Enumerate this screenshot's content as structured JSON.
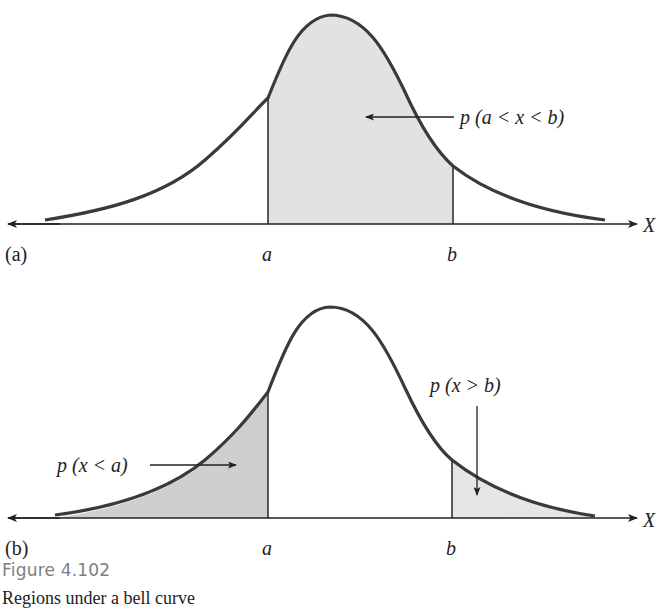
{
  "figure": {
    "number": "Figure 4.102",
    "caption": "Regions under a bell curve"
  },
  "panel_a": {
    "tag": "(a)",
    "axis_label": "X",
    "left_bound_label": "a",
    "right_bound_label": "b",
    "annotation": "p (a < x < b)",
    "shaded_region": "between a and b"
  },
  "panel_b": {
    "tag": "(b)",
    "axis_label": "X",
    "left_bound_label": "a",
    "right_bound_label": "b",
    "annotation_left": "p (x < a)",
    "annotation_right": "p (x > b)",
    "shaded_regions": [
      "left of a",
      "right of b"
    ]
  },
  "colors": {
    "curve": "#3a3a3a",
    "shade_middle": "#e2e2e2",
    "shade_left": "#cfcfcf",
    "shade_right": "#e6e6e6",
    "axis": "#222222",
    "caption_title": "#7a7f86"
  }
}
